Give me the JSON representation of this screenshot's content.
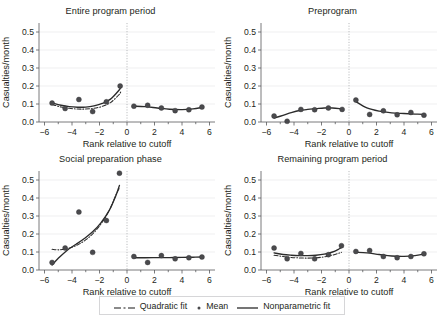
{
  "figure": {
    "axis_title_x": "Rank relative to cutoff",
    "axis_title_y": "Casualties/month",
    "y_ticks": [
      "0.0",
      "0.1",
      "0.2",
      "0.3",
      "0.4",
      "0.5"
    ],
    "x_ticks": [
      "-6",
      "-4",
      "-2",
      "0",
      "2",
      "4",
      "6"
    ],
    "colors": {
      "marker": "#4a4a4d",
      "fit_line": "#2b2b2b",
      "axis": "#58595b",
      "grid": "#e8e8ea",
      "cutoff": "#a7a9ac",
      "legend_border": "#d6d6d8",
      "background": "#ffffff",
      "text": "#231f20"
    }
  },
  "legend": {
    "items": [
      {
        "label": "Quadratic fit",
        "marker": "dash-dot-line"
      },
      {
        "label": "Mean",
        "marker": "filled-circle"
      },
      {
        "label": "Nonparametric fit",
        "marker": "solid-line"
      }
    ]
  },
  "chart_data": [
    {
      "type": "scatter",
      "title": "Entire program period",
      "xlabel": "Rank relative to cutoff",
      "ylabel": "Casualties/month",
      "xlim": [
        -6.4,
        6.4
      ],
      "ylim": [
        0.0,
        0.55
      ],
      "grid": true,
      "cutoff": 0,
      "series": [
        {
          "name": "Mean",
          "side": "left",
          "x": [
            -5.45,
            -4.5,
            -3.5,
            -2.5,
            -1.5,
            -0.5
          ],
          "y": [
            0.105,
            0.075,
            0.125,
            0.058,
            0.112,
            0.2
          ]
        },
        {
          "name": "Mean",
          "side": "right",
          "x": [
            0.5,
            1.5,
            2.5,
            3.5,
            4.5,
            5.45
          ],
          "y": [
            0.088,
            0.093,
            0.078,
            0.063,
            0.068,
            0.083
          ]
        },
        {
          "name": "Nonparametric fit",
          "side": "left",
          "x": [
            -5.45,
            -4.8,
            -4.2,
            -3.6,
            -3.0,
            -2.4,
            -1.8,
            -1.2,
            -0.6,
            -0.45
          ],
          "y": [
            0.106,
            0.093,
            0.085,
            0.082,
            0.083,
            0.09,
            0.103,
            0.127,
            0.175,
            0.195
          ]
        },
        {
          "name": "Nonparametric fit",
          "side": "right",
          "x": [
            0.5,
            1.3,
            2.2,
            3.1,
            4.0,
            4.8,
            5.45
          ],
          "y": [
            0.088,
            0.085,
            0.078,
            0.071,
            0.069,
            0.073,
            0.081
          ]
        },
        {
          "name": "Quadratic fit",
          "side": "left",
          "x": [
            -5.45,
            -4.8,
            -4.2,
            -3.6,
            -3.0,
            -2.4,
            -1.8,
            -1.2,
            -0.6,
            -0.45
          ],
          "y": [
            0.098,
            0.083,
            0.076,
            0.072,
            0.072,
            0.076,
            0.087,
            0.108,
            0.15,
            0.168
          ]
        }
      ]
    },
    {
      "type": "scatter",
      "title": "Preprogram",
      "xlabel": "Rank relative to cutoff",
      "ylabel": "Casualties/month",
      "xlim": [
        -6.4,
        6.4
      ],
      "ylim": [
        0.0,
        0.55
      ],
      "grid": true,
      "cutoff": 0,
      "series": [
        {
          "name": "Mean",
          "side": "left",
          "x": [
            -5.45,
            -4.5,
            -3.5,
            -2.5,
            -1.5,
            -0.5
          ],
          "y": [
            0.033,
            0.004,
            0.07,
            0.068,
            0.078,
            0.07
          ]
        },
        {
          "name": "Mean",
          "side": "right",
          "x": [
            0.5,
            1.5,
            2.5,
            3.5,
            4.5,
            5.45
          ],
          "y": [
            0.122,
            0.042,
            0.062,
            0.04,
            0.053,
            0.038
          ]
        },
        {
          "name": "Nonparametric fit",
          "side": "left",
          "x": [
            -5.45,
            -4.8,
            -4.2,
            -3.6,
            -3.0,
            -2.4,
            -1.8,
            -1.2,
            -0.6,
            -0.45
          ],
          "y": [
            0.022,
            0.037,
            0.052,
            0.064,
            0.07,
            0.074,
            0.078,
            0.078,
            0.073,
            0.071
          ]
        },
        {
          "name": "Nonparametric fit",
          "side": "right",
          "x": [
            0.5,
            1.3,
            2.2,
            3.1,
            4.0,
            4.8,
            5.45
          ],
          "y": [
            0.113,
            0.078,
            0.06,
            0.051,
            0.047,
            0.044,
            0.042
          ]
        }
      ]
    },
    {
      "type": "scatter",
      "title": "Social preparation phase",
      "xlabel": "Rank relative to cutoff",
      "ylabel": "Casualties/month",
      "xlim": [
        -6.4,
        6.4
      ],
      "ylim": [
        0.0,
        0.55
      ],
      "grid": true,
      "cutoff": 0,
      "series": [
        {
          "name": "Mean",
          "side": "left",
          "x": [
            -5.45,
            -4.5,
            -3.5,
            -2.5,
            -1.5,
            -0.55
          ],
          "y": [
            0.042,
            0.122,
            0.322,
            0.098,
            0.275,
            0.538
          ]
        },
        {
          "name": "Mean",
          "side": "right",
          "x": [
            0.5,
            1.5,
            2.5,
            3.5,
            4.5,
            5.45
          ],
          "y": [
            0.075,
            0.042,
            0.08,
            0.062,
            0.068,
            0.072
          ]
        },
        {
          "name": "Nonparametric fit",
          "side": "left",
          "x": [
            -5.45,
            -4.9,
            -4.3,
            -3.7,
            -3.1,
            -2.5,
            -1.9,
            -1.3,
            -0.8,
            -0.55
          ],
          "y": [
            0.028,
            0.072,
            0.113,
            0.143,
            0.175,
            0.212,
            0.262,
            0.33,
            0.415,
            0.47
          ]
        },
        {
          "name": "Nonparametric fit",
          "side": "right",
          "x": [
            0.5,
            1.3,
            2.2,
            3.1,
            4.0,
            4.8,
            5.45
          ],
          "y": [
            0.068,
            0.068,
            0.069,
            0.069,
            0.07,
            0.071,
            0.072
          ]
        },
        {
          "name": "Quadratic fit",
          "side": "left",
          "x": [
            -5.45,
            -4.9,
            -4.3,
            -3.7,
            -3.1,
            -2.5,
            -1.9,
            -1.3,
            -0.8,
            -0.55
          ],
          "y": [
            0.115,
            0.112,
            0.12,
            0.136,
            0.162,
            0.2,
            0.255,
            0.33,
            0.418,
            0.455
          ]
        }
      ]
    },
    {
      "type": "scatter",
      "title": "Remaining program period",
      "xlabel": "Rank relative to cutoff",
      "ylabel": "Casualties/month",
      "xlim": [
        -6.4,
        6.4
      ],
      "ylim": [
        0.0,
        0.55
      ],
      "grid": true,
      "cutoff": 0,
      "series": [
        {
          "name": "Mean",
          "side": "left",
          "x": [
            -5.45,
            -4.5,
            -3.5,
            -2.5,
            -1.5,
            -0.55
          ],
          "y": [
            0.122,
            0.062,
            0.092,
            0.062,
            0.085,
            0.135
          ]
        },
        {
          "name": "Mean",
          "side": "right",
          "x": [
            0.5,
            1.5,
            2.5,
            3.5,
            4.5,
            5.45
          ],
          "y": [
            0.103,
            0.108,
            0.075,
            0.068,
            0.075,
            0.09
          ]
        },
        {
          "name": "Nonparametric fit",
          "side": "left",
          "x": [
            -5.45,
            -4.8,
            -4.2,
            -3.6,
            -3.0,
            -2.4,
            -1.8,
            -1.2,
            -0.7,
            -0.55
          ],
          "y": [
            0.095,
            0.086,
            0.082,
            0.08,
            0.08,
            0.082,
            0.088,
            0.1,
            0.118,
            0.125
          ]
        },
        {
          "name": "Nonparametric fit",
          "side": "right",
          "x": [
            0.5,
            1.3,
            2.2,
            3.1,
            4.0,
            4.8,
            5.45
          ],
          "y": [
            0.098,
            0.095,
            0.086,
            0.078,
            0.076,
            0.08,
            0.088
          ]
        },
        {
          "name": "Quadratic fit",
          "side": "left",
          "x": [
            -5.45,
            -4.8,
            -4.2,
            -3.6,
            -3.0,
            -2.4,
            -1.8,
            -1.2,
            -0.7,
            -0.55
          ],
          "y": [
            0.082,
            0.075,
            0.07,
            0.067,
            0.066,
            0.068,
            0.073,
            0.083,
            0.094,
            0.098
          ]
        }
      ]
    }
  ]
}
